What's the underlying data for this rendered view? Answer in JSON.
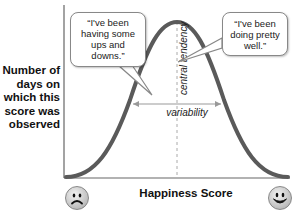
{
  "y_axis_label": "Number of days on which this score was observed",
  "y_axis_lines": [
    "Number of",
    "days on",
    "which this",
    "score was",
    "observed"
  ],
  "x_axis_label": "Happiness Score",
  "bubbles": {
    "left": {
      "lines": [
        "“I've been",
        "having some",
        "ups and",
        "downs.”"
      ]
    },
    "right": {
      "lines": [
        "“I've been",
        "doing pretty",
        "well.”"
      ]
    }
  },
  "annotations": {
    "central_tendency": "central tendency",
    "variability": "variability"
  },
  "icons": {
    "left_end": "sad-face-icon",
    "right_end": "happy-face-icon"
  },
  "colors": {
    "curve": "#555555",
    "axis": "#555555",
    "dashed_line": "#aaaaaa"
  }
}
